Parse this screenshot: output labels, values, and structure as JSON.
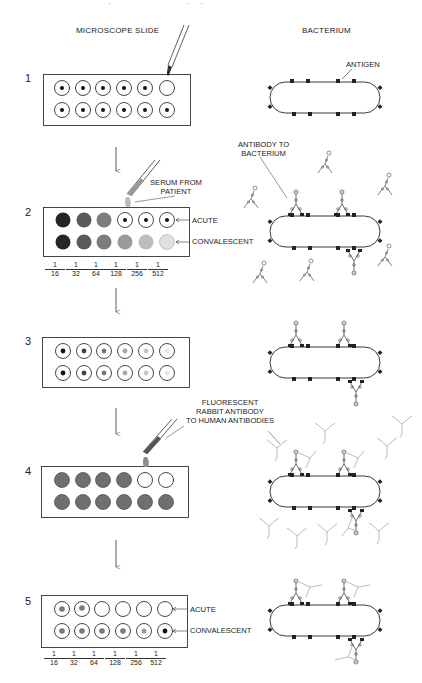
{
  "header": {
    "running_head": "134   CHAPTER 6   Laboratory Test Methods",
    "left_column_title": "MICROSCOPE SLIDE",
    "right_column_title": "BACTERIUM"
  },
  "steps": [
    {
      "number": "1",
      "labels": {
        "antigen": "ANTIGEN"
      },
      "wells": {
        "row1": [
          "dot",
          "dot",
          "dot",
          "dot",
          "dot",
          "empty"
        ],
        "row2": [
          "dot",
          "dot",
          "dot",
          "dot",
          "dot",
          "dot"
        ]
      }
    },
    {
      "number": "2",
      "labels": {
        "serum": "SERUM FROM PATIENT",
        "serum_line1": "SERUM FROM",
        "serum_line2": "PATIENT",
        "antibody": "ANTIBODY TO BACTERIUM",
        "antibody_line1": "ANTIBODY TO",
        "antibody_line2": "BACTERIUM",
        "row1": "ACUTE",
        "row2": "CONVALESCENT"
      },
      "wells": {
        "row1": [
          "#262626",
          "#5a5a5a",
          "#7c7c7c",
          "dot",
          "dot",
          "dot"
        ],
        "row2": [
          "#262626",
          "#5a5a5a",
          "#7c7c7c",
          "#9a9a9a",
          "#bdbdbd",
          "#dedede"
        ]
      },
      "dilutions": [
        "16",
        "32",
        "64",
        "128",
        "256",
        "512"
      ]
    },
    {
      "number": "3",
      "wells": {
        "row1": [
          "#111111",
          "#444444",
          "#777777",
          "#a8a8a8",
          "#c6c6c6",
          "#e6e6e6"
        ],
        "row2": [
          "#111111",
          "#444444",
          "#777777",
          "#a8a8a8",
          "#c6c6c6",
          "#e6e6e6"
        ]
      }
    },
    {
      "number": "4",
      "labels": {
        "fluorescent": "FLUORESCENT RABBIT ANTIBODY TO HUMAN ANTIBODIES",
        "fluor_line1": "FLUORESCENT",
        "fluor_line2": "RABBIT ANTIBODY",
        "fluor_line3": "TO HUMAN ANTIBODIES"
      },
      "wells": {
        "row1": [
          "filled",
          "filled",
          "filled",
          "filled",
          "empty",
          "empty"
        ],
        "row2": [
          "filled",
          "filled",
          "filled",
          "filled",
          "filled",
          "filled"
        ]
      }
    },
    {
      "number": "5",
      "labels": {
        "row1": "ACUTE",
        "row2": "CONVALESCENT"
      },
      "wells": {
        "row1": [
          "gray-dot",
          "gray-dot",
          "empty",
          "empty",
          "empty",
          "empty"
        ],
        "row2": [
          "gray-dot",
          "gray-dot",
          "gray-dot",
          "gray-dot",
          "gray-dot",
          "black-dot"
        ]
      },
      "dilutions": [
        "16",
        "32",
        "64",
        "128",
        "256",
        "512"
      ]
    }
  ],
  "fraction_numerator": "1",
  "colors": {
    "ink": "#1a1a1a",
    "fluorescent_antibody": "#a9a9a9",
    "serum_drop": "#bdbdbd",
    "fluor_drop": "#8c8c8c",
    "well_fill_step4": "#6f6f6f"
  }
}
